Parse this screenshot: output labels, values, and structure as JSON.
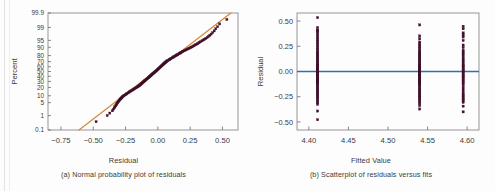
{
  "figure": {
    "background": "#fdfdfd",
    "panels": [
      {
        "id": "a",
        "axis_title_x": "Residual",
        "axis_title_y": "Percent",
        "caption": "(a) Normal probability plot of residuals"
      },
      {
        "id": "b",
        "axis_title_x": "Fitted Value",
        "axis_title_y": "Residual",
        "caption": "(b) Scatterplot of residuals versus fits"
      }
    ]
  },
  "colors": {
    "point": "#4a1230",
    "point_edge": "#2e0b20",
    "fit_line": "#d98a3d",
    "zero_line": "#2f6fb5",
    "axis": "#6b6b6b",
    "text": "#3b3b3b",
    "frame": "#8a8a8a"
  },
  "chart_data": [
    {
      "type": "scatter",
      "title": "(a) Normal probability plot of residuals",
      "xlabel": "Residual",
      "ylabel": "Percent",
      "xlim": [
        -0.85,
        0.62
      ],
      "ylim_percent": [
        0.1,
        99.9
      ],
      "grid": false,
      "legend": null,
      "xticks": [
        -0.75,
        -0.5,
        -0.25,
        0.0,
        0.25,
        0.5
      ],
      "xticklabels": [
        "-0.75",
        "-0.50",
        "-0.25",
        "0.00",
        "0.25",
        "0.50"
      ],
      "yticks": [
        0.1,
        1,
        5,
        10,
        20,
        30,
        40,
        50,
        60,
        70,
        80,
        90,
        95,
        99,
        99.9
      ],
      "yticklabels": [
        "0.1",
        "1",
        "5",
        "10",
        "20",
        "30",
        "40",
        "50",
        "60",
        "70",
        "80",
        "90",
        "95",
        "99",
        "99.9"
      ],
      "reference_line": {
        "name": "normal-fit-line",
        "color": "#d98a3d",
        "x_start": -0.61,
        "y_start_percent": 0.1,
        "x_end": 0.565,
        "y_end_percent": 99.9
      },
      "series": [
        {
          "name": "residual-quantiles",
          "marker": "square",
          "color": "#4a1230",
          "x": [
            -0.478,
            -0.392,
            -0.372,
            -0.352,
            -0.344,
            -0.338,
            -0.332,
            -0.326,
            -0.322,
            -0.318,
            -0.314,
            -0.31,
            -0.306,
            -0.302,
            -0.298,
            -0.294,
            -0.29,
            -0.286,
            -0.282,
            -0.278,
            -0.274,
            -0.27,
            -0.264,
            -0.258,
            -0.252,
            -0.246,
            -0.24,
            -0.234,
            -0.228,
            -0.222,
            -0.216,
            -0.21,
            -0.204,
            -0.198,
            -0.192,
            -0.186,
            -0.18,
            -0.174,
            -0.168,
            -0.162,
            -0.156,
            -0.15,
            -0.146,
            -0.142,
            -0.138,
            -0.134,
            -0.13,
            -0.126,
            -0.122,
            -0.118,
            -0.114,
            -0.11,
            -0.106,
            -0.102,
            -0.098,
            -0.094,
            -0.09,
            -0.086,
            -0.082,
            -0.078,
            -0.074,
            -0.07,
            -0.066,
            -0.062,
            -0.058,
            -0.054,
            -0.05,
            -0.046,
            -0.042,
            -0.038,
            -0.034,
            -0.03,
            -0.026,
            -0.022,
            -0.018,
            -0.014,
            -0.01,
            -0.006,
            -0.002,
            0.002,
            0.006,
            0.01,
            0.014,
            0.018,
            0.022,
            0.026,
            0.03,
            0.034,
            0.038,
            0.042,
            0.046,
            0.05,
            0.054,
            0.058,
            0.062,
            0.066,
            0.07,
            0.076,
            0.082,
            0.088,
            0.094,
            0.1,
            0.106,
            0.112,
            0.118,
            0.124,
            0.13,
            0.136,
            0.142,
            0.148,
            0.154,
            0.16,
            0.166,
            0.172,
            0.178,
            0.184,
            0.19,
            0.196,
            0.204,
            0.212,
            0.22,
            0.228,
            0.236,
            0.244,
            0.252,
            0.26,
            0.268,
            0.276,
            0.284,
            0.292,
            0.3,
            0.308,
            0.316,
            0.324,
            0.332,
            0.342,
            0.352,
            0.362,
            0.372,
            0.382,
            0.392,
            0.402,
            0.412,
            0.424,
            0.436,
            0.448,
            0.462,
            0.478,
            0.534
          ],
          "percent": [
            0.4,
            1.0,
            1.4,
            1.9,
            2.3,
            2.7,
            3.1,
            3.5,
            3.9,
            4.3,
            4.7,
            5.1,
            5.5,
            5.9,
            6.3,
            6.8,
            7.2,
            7.6,
            8.0,
            8.5,
            8.9,
            9.4,
            9.9,
            10.4,
            10.9,
            11.5,
            12.0,
            12.6,
            13.2,
            13.8,
            14.4,
            15.0,
            15.6,
            16.2,
            16.9,
            17.5,
            18.2,
            18.9,
            19.6,
            20.3,
            21.0,
            21.7,
            22.4,
            23.1,
            23.8,
            24.6,
            25.3,
            26.1,
            26.9,
            27.7,
            28.5,
            29.3,
            30.1,
            30.9,
            31.8,
            32.6,
            33.5,
            34.3,
            35.2,
            36.1,
            37.0,
            37.9,
            38.8,
            39.7,
            40.6,
            41.5,
            42.4,
            43.4,
            44.3,
            45.3,
            46.2,
            47.2,
            48.2,
            49.1,
            50.1,
            51.1,
            52.1,
            53.1,
            54.1,
            55.1,
            56.1,
            57.0,
            58.0,
            59.0,
            60.0,
            60.9,
            61.9,
            62.8,
            63.8,
            64.7,
            65.6,
            66.5,
            67.4,
            68.3,
            69.2,
            70.1,
            70.9,
            71.8,
            72.6,
            73.4,
            74.2,
            75.0,
            75.8,
            76.6,
            77.3,
            78.1,
            78.8,
            79.5,
            80.2,
            80.9,
            81.5,
            82.2,
            82.8,
            83.4,
            84.0,
            84.6,
            85.2,
            85.8,
            86.4,
            87.0,
            87.5,
            88.1,
            88.6,
            89.1,
            89.6,
            90.1,
            90.6,
            91.1,
            91.6,
            92.1,
            92.5,
            93.0,
            93.4,
            93.9,
            94.3,
            94.8,
            95.2,
            95.6,
            96.0,
            96.4,
            96.8,
            97.2,
            97.6,
            98.0,
            98.4,
            98.8,
            99.1,
            99.4,
            99.7
          ]
        }
      ]
    },
    {
      "type": "scatter",
      "title": "(b) Scatterplot of residuals versus fits",
      "xlabel": "Fitted Value",
      "ylabel": "Residual",
      "xlim": [
        4.385,
        4.615
      ],
      "ylim": [
        -0.58,
        0.58
      ],
      "grid": false,
      "legend": null,
      "xticks": [
        4.4,
        4.45,
        4.5,
        4.55,
        4.6
      ],
      "xticklabels": [
        "4.40",
        "4.45",
        "4.50",
        "4.55",
        "4.60"
      ],
      "yticks": [
        -0.5,
        -0.25,
        0.0,
        0.25,
        0.5
      ],
      "yticklabels": [
        "-0.50",
        "-0.25",
        "0.00",
        "0.25",
        "0.50"
      ],
      "reference_line": {
        "name": "zero-residual-line",
        "color": "#2f6fb5",
        "y": 0.0
      },
      "groups": [
        {
          "name": "fitted-4.41",
          "x": 4.411,
          "marker": "square",
          "color": "#4a1230",
          "residuals": [
            0.534,
            0.436,
            0.412,
            0.402,
            0.392,
            0.372,
            0.352,
            0.332,
            0.316,
            0.3,
            0.284,
            0.268,
            0.252,
            0.236,
            0.22,
            0.204,
            0.19,
            0.178,
            0.166,
            0.154,
            0.142,
            0.13,
            0.118,
            0.106,
            0.094,
            0.082,
            0.07,
            0.062,
            0.054,
            0.046,
            0.038,
            0.03,
            0.022,
            0.014,
            0.006,
            -0.002,
            -0.01,
            -0.018,
            -0.026,
            -0.034,
            -0.042,
            -0.05,
            -0.058,
            -0.066,
            -0.074,
            -0.082,
            -0.09,
            -0.098,
            -0.106,
            -0.114,
            -0.122,
            -0.13,
            -0.142,
            -0.156,
            -0.168,
            -0.18,
            -0.192,
            -0.204,
            -0.216,
            -0.228,
            -0.24,
            -0.252,
            -0.264,
            -0.278,
            -0.294,
            -0.31,
            -0.326,
            -0.392,
            -0.478
          ]
        },
        {
          "name": "fitted-4.54",
          "x": 4.54,
          "marker": "square",
          "color": "#4a1230",
          "residuals": [
            0.462,
            0.352,
            0.324,
            0.292,
            0.276,
            0.26,
            0.244,
            0.228,
            0.212,
            0.196,
            0.184,
            0.172,
            0.16,
            0.148,
            0.136,
            0.124,
            0.112,
            0.1,
            0.088,
            0.076,
            0.066,
            0.058,
            0.05,
            0.042,
            0.034,
            0.026,
            0.018,
            0.01,
            0.002,
            -0.006,
            -0.014,
            -0.022,
            -0.03,
            -0.038,
            -0.046,
            -0.054,
            -0.062,
            -0.07,
            -0.078,
            -0.086,
            -0.094,
            -0.102,
            -0.11,
            -0.118,
            -0.126,
            -0.134,
            -0.146,
            -0.162,
            -0.174,
            -0.186,
            -0.198,
            -0.21,
            -0.222,
            -0.234,
            -0.246,
            -0.258,
            -0.27,
            -0.286,
            -0.302,
            -0.318,
            -0.338,
            -0.372
          ]
        },
        {
          "name": "fitted-4.595",
          "x": 4.595,
          "marker": "square",
          "color": "#4a1230",
          "residuals": [
            0.448,
            0.424,
            0.382,
            0.362,
            0.342,
            0.308,
            0.262,
            0.238,
            0.21,
            0.193,
            0.175,
            0.158,
            0.14,
            0.122,
            0.105,
            0.088,
            0.072,
            0.06,
            0.048,
            0.036,
            0.024,
            0.012,
            0.0,
            -0.012,
            -0.024,
            -0.036,
            -0.048,
            -0.06,
            -0.072,
            -0.086,
            -0.1,
            -0.114,
            -0.128,
            -0.15,
            -0.172,
            -0.194,
            -0.216,
            -0.232,
            -0.248,
            -0.262,
            -0.276,
            -0.29,
            -0.306,
            -0.344,
            -0.4
          ]
        }
      ]
    }
  ]
}
